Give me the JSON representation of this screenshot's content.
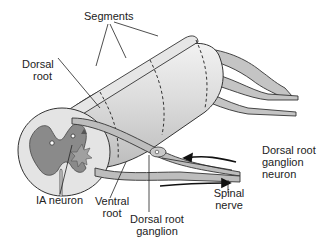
{
  "diagram": {
    "colors": {
      "outline": "#333333",
      "cord_fill": "#d8d8d8",
      "cord_light": "#ececec",
      "gray_matter": "#8a8a8a",
      "nerve_fill": "#bdbdbd",
      "text": "#222222"
    },
    "labels": {
      "segments": "Segments",
      "dorsal_root_1": "Dorsal",
      "dorsal_root_2": "root",
      "ia_neuron": "IA neuron",
      "ventral_root_1": "Ventral",
      "ventral_root_2": "root",
      "drg_1": "Dorsal root",
      "drg_2": "ganglion",
      "drg_neuron_1": "Dorsal root",
      "drg_neuron_2": "ganglion",
      "drg_neuron_3": "neuron",
      "spinal_nerve_1": "Spinal",
      "spinal_nerve_2": "nerve"
    }
  }
}
